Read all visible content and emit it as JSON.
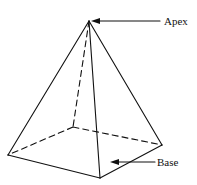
{
  "diagram": {
    "type": "square-pyramid",
    "labels": {
      "apex": "Apex",
      "base": "Base"
    },
    "colors": {
      "stroke": "#111111",
      "background": "#ffffff"
    }
  }
}
